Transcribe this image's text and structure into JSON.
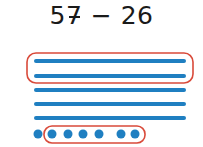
{
  "expression": {
    "minuend_tens": "5",
    "minuend_ones": "7",
    "operator": "−",
    "subtrahend": "26"
  },
  "model": {
    "tens_count": 5,
    "ones_count": 7,
    "tens_circled": 2,
    "ones_circled": 6,
    "colors": {
      "blocks": "#1f7fc1",
      "circle": "#d94a3a"
    }
  }
}
